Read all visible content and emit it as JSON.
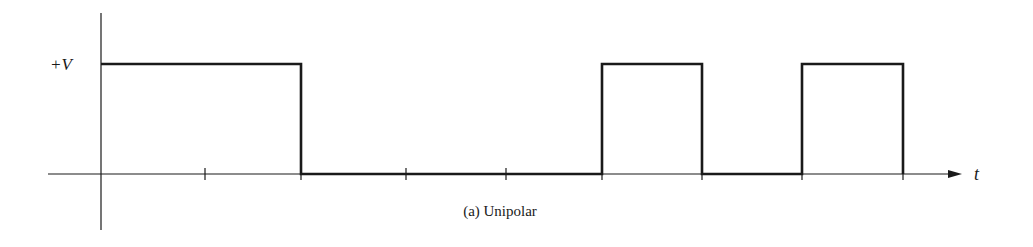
{
  "diagram": {
    "caption": "(a) Unipolar",
    "y_label": "+V",
    "x_label": "t",
    "line_color": "#1a1a1a",
    "axes": {
      "origin_x": 101,
      "baseline_y": 174,
      "high_y": 64,
      "y_axis_top": 13,
      "y_axis_bottom": 230,
      "x_axis_left": 48,
      "x_axis_arrow_tip": 962
    },
    "ticks_x": [
      205,
      301,
      406,
      506,
      602,
      702,
      802,
      903
    ],
    "bits": [
      1,
      1,
      0,
      0,
      0,
      1,
      0,
      1
    ],
    "bit_boundaries_x": [
      101,
      205,
      301,
      406,
      506,
      602,
      702,
      802,
      903
    ]
  },
  "chart_data": {
    "type": "line",
    "title": "(a) Unipolar",
    "xlabel": "t",
    "ylabel": "+V",
    "signal": "unipolar NRZ",
    "x": [
      0,
      1,
      2,
      3,
      4,
      5,
      6,
      7,
      8
    ],
    "levels": [
      1,
      1,
      0,
      0,
      0,
      1,
      0,
      1
    ],
    "y_levels": {
      "high": "+V",
      "low": "0"
    }
  }
}
